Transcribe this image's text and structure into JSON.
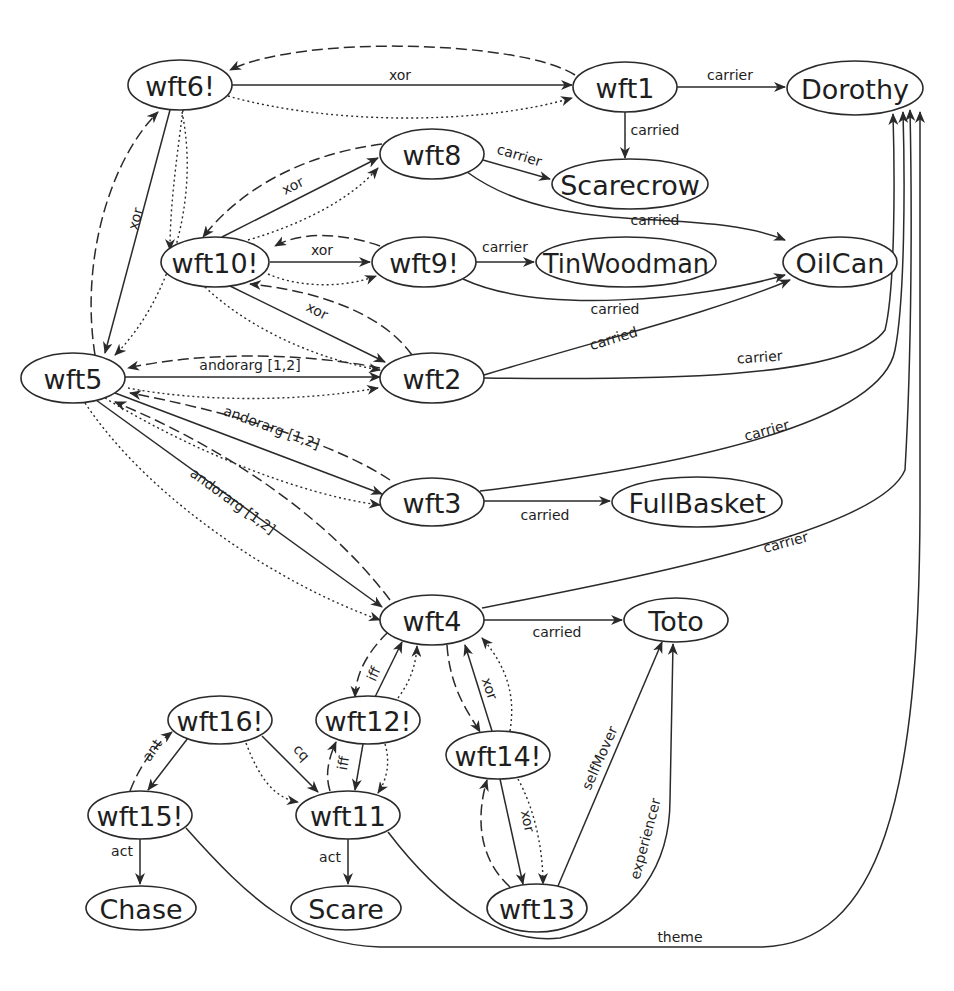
{
  "diagram": {
    "type": "propositional semantic network",
    "nodes": [
      {
        "id": "wft6",
        "label": "wft6!",
        "cx": 180,
        "cy": 85,
        "rx": 52,
        "ry": 25
      },
      {
        "id": "wft1",
        "label": "wft1",
        "cx": 625,
        "cy": 87,
        "rx": 52,
        "ry": 25
      },
      {
        "id": "Dorothy",
        "label": "Dorothy",
        "cx": 855,
        "cy": 88,
        "rx": 68,
        "ry": 27
      },
      {
        "id": "wft8",
        "label": "wft8",
        "cx": 432,
        "cy": 154,
        "rx": 52,
        "ry": 25
      },
      {
        "id": "Scarecrow",
        "label": "Scarecrow",
        "cx": 630,
        "cy": 184,
        "rx": 78,
        "ry": 25
      },
      {
        "id": "wft10",
        "label": "wft10!",
        "cx": 215,
        "cy": 262,
        "rx": 54,
        "ry": 25
      },
      {
        "id": "wft9",
        "label": "wft9!",
        "cx": 424,
        "cy": 262,
        "rx": 52,
        "ry": 25
      },
      {
        "id": "TinWoodman",
        "label": "TinWoodman",
        "cx": 626,
        "cy": 262,
        "rx": 90,
        "ry": 25
      },
      {
        "id": "OilCan",
        "label": "OilCan",
        "cx": 840,
        "cy": 262,
        "rx": 57,
        "ry": 25
      },
      {
        "id": "wft5",
        "label": "wft5",
        "cx": 73,
        "cy": 378,
        "rx": 52,
        "ry": 25
      },
      {
        "id": "wft2",
        "label": "wft2",
        "cx": 432,
        "cy": 378,
        "rx": 52,
        "ry": 25
      },
      {
        "id": "wft3",
        "label": "wft3",
        "cx": 432,
        "cy": 502,
        "rx": 52,
        "ry": 24
      },
      {
        "id": "FullBasket",
        "label": "FullBasket",
        "cx": 697,
        "cy": 502,
        "rx": 85,
        "ry": 25
      },
      {
        "id": "wft4",
        "label": "wft4",
        "cx": 432,
        "cy": 620,
        "rx": 52,
        "ry": 25
      },
      {
        "id": "Toto",
        "label": "Toto",
        "cx": 676,
        "cy": 620,
        "rx": 52,
        "ry": 22
      },
      {
        "id": "wft16",
        "label": "wft16!",
        "cx": 220,
        "cy": 720,
        "rx": 52,
        "ry": 24
      },
      {
        "id": "wft12",
        "label": "wft12!",
        "cx": 368,
        "cy": 720,
        "rx": 52,
        "ry": 24
      },
      {
        "id": "wft14",
        "label": "wft14!",
        "cx": 498,
        "cy": 755,
        "rx": 52,
        "ry": 24
      },
      {
        "id": "wft15",
        "label": "wft15!",
        "cx": 140,
        "cy": 815,
        "rx": 52,
        "ry": 24
      },
      {
        "id": "wft11",
        "label": "wft11",
        "cx": 348,
        "cy": 815,
        "rx": 52,
        "ry": 24
      },
      {
        "id": "Chase",
        "label": "Chase",
        "cx": 141,
        "cy": 908,
        "rx": 55,
        "ry": 22
      },
      {
        "id": "Scare",
        "label": "Scare",
        "cx": 346,
        "cy": 908,
        "rx": 55,
        "ry": 22
      },
      {
        "id": "wft13",
        "label": "wft13",
        "cx": 537,
        "cy": 908,
        "rx": 50,
        "ry": 24
      }
    ],
    "edges": [
      {
        "id": "e1",
        "from": "wft6",
        "to": "wft1",
        "label": "xor",
        "style": "solid",
        "d": "M232,85 L572,85",
        "lx": 400,
        "ly": 80,
        "rot": 0
      },
      {
        "id": "e2",
        "from": "wft1",
        "to": "wft6",
        "label": "",
        "style": "dashed",
        "d": "M575,75 C520,40 300,35 230,70",
        "lx": 0,
        "ly": 0,
        "rot": 0
      },
      {
        "id": "e3",
        "from": "wft6",
        "to": "wft1",
        "label": "",
        "style": "dotted",
        "d": "M228,96 C330,125 480,125 572,98",
        "lx": 0,
        "ly": 0,
        "rot": 0
      },
      {
        "id": "e4",
        "from": "wft1",
        "to": "Dorothy",
        "label": "carrier",
        "style": "solid",
        "d": "M677,87 L785,87",
        "lx": 730,
        "ly": 80,
        "rot": 0
      },
      {
        "id": "e5",
        "from": "wft1",
        "to": "Scarecrow",
        "label": "carried",
        "style": "solid",
        "d": "M625,112 L625,158",
        "lx": 655,
        "ly": 135,
        "rot": 0
      },
      {
        "id": "e6",
        "from": "wft6",
        "to": "wft5",
        "label": "xor",
        "style": "solid",
        "d": "M170,110 L105,353",
        "lx": 140,
        "ly": 220,
        "rot": -75
      },
      {
        "id": "e7",
        "from": "wft5",
        "to": "wft6",
        "label": "",
        "style": "dashed",
        "d": "M95,355 C80,260 110,160 158,112",
        "lx": 0,
        "ly": 0,
        "rot": 0
      },
      {
        "id": "e8",
        "from": "wft6",
        "to": "wft5",
        "label": "",
        "style": "dotted",
        "d": "M182,112 C200,200 170,300 115,355",
        "lx": 0,
        "ly": 0,
        "rot": 0
      },
      {
        "id": "e9",
        "from": "wft10",
        "to": "wft8",
        "label": "xor",
        "style": "solid",
        "d": "M222,237 L378,158",
        "lx": 295,
        "ly": 190,
        "rot": -27
      },
      {
        "id": "e10",
        "from": "wft8",
        "to": "wft10",
        "label": "",
        "style": "dashed",
        "d": "M382,144 C300,155 240,190 203,237",
        "lx": 0,
        "ly": 0,
        "rot": 0
      },
      {
        "id": "e11",
        "from": "wft10",
        "to": "wft8",
        "label": "",
        "style": "dotted",
        "d": "M248,240 C300,225 350,200 378,168",
        "lx": 0,
        "ly": 0,
        "rot": 0
      },
      {
        "id": "e12",
        "from": "wft8",
        "to": "Scarecrow",
        "label": "carrier",
        "style": "solid",
        "d": "M483,160 L550,179",
        "lx": 518,
        "ly": 160,
        "rot": 17
      },
      {
        "id": "e13",
        "from": "wft8",
        "to": "OilCan",
        "label": "carried",
        "style": "solid",
        "d": "M467,172 C560,240 700,205 785,240",
        "lx": 655,
        "ly": 225,
        "rot": 0
      },
      {
        "id": "e14",
        "from": "wft10",
        "to": "wft9",
        "label": "xor",
        "style": "solid",
        "d": "M270,262 L370,262",
        "lx": 322,
        "ly": 255,
        "rot": 0
      },
      {
        "id": "e15",
        "from": "wft9",
        "to": "wft10",
        "label": "",
        "style": "dashed",
        "d": "M380,246 C340,232 300,232 275,246",
        "lx": 0,
        "ly": 0,
        "rot": 0
      },
      {
        "id": "e16",
        "from": "wft10",
        "to": "wft9",
        "label": "",
        "style": "dotted",
        "d": "M268,274 C300,288 345,288 376,276",
        "lx": 0,
        "ly": 0,
        "rot": 0
      },
      {
        "id": "e17",
        "from": "wft9",
        "to": "TinWoodman",
        "label": "carrier",
        "style": "solid",
        "d": "M476,262 L534,262",
        "lx": 505,
        "ly": 252,
        "rot": 0
      },
      {
        "id": "e18",
        "from": "wft9",
        "to": "OilCan",
        "label": "carried",
        "style": "solid",
        "d": "M463,279 C540,315 700,300 785,275",
        "lx": 615,
        "ly": 314,
        "rot": 0
      },
      {
        "id": "e19",
        "from": "wft10",
        "to": "wft2",
        "label": "xor",
        "style": "solid",
        "d": "M230,286 L385,362",
        "lx": 315,
        "ly": 315,
        "rot": 27
      },
      {
        "id": "e20",
        "from": "wft2",
        "to": "wft10",
        "label": "",
        "style": "dashed",
        "d": "M412,355 C380,310 310,290 250,284",
        "lx": 0,
        "ly": 0,
        "rot": 0
      },
      {
        "id": "e21",
        "from": "wft10",
        "to": "wft2",
        "label": "",
        "style": "dotted",
        "d": "M205,287 C250,330 320,360 380,370",
        "lx": 0,
        "ly": 0,
        "rot": 0
      },
      {
        "id": "e22",
        "from": "wft6",
        "to": "wft10",
        "label": "",
        "style": "dotted",
        "d": "M183,110 C175,170 170,210 170,250",
        "lx": 0,
        "ly": 0,
        "rot": 0
      },
      {
        "id": "e23",
        "from": "wft5",
        "to": "wft2",
        "label": "andorarg [1,2]",
        "style": "solid",
        "d": "M125,377 L380,377",
        "lx": 250,
        "ly": 370,
        "rot": 0
      },
      {
        "id": "e24",
        "from": "wft2",
        "to": "wft5",
        "label": "",
        "style": "dashed",
        "d": "M380,368 C300,352 200,352 128,368",
        "lx": 0,
        "ly": 0,
        "rot": 0
      },
      {
        "id": "e25",
        "from": "wft5",
        "to": "wft2",
        "label": "",
        "style": "dotted",
        "d": "M128,388 C200,402 300,402 378,388",
        "lx": 0,
        "ly": 0,
        "rot": 0
      },
      {
        "id": "e26",
        "from": "wft5",
        "to": "wft3",
        "label": "andorarg [1,2]",
        "style": "solid",
        "d": "M115,393 L382,494",
        "lx": 270,
        "ly": 432,
        "rot": 20
      },
      {
        "id": "e27",
        "from": "wft3",
        "to": "wft5",
        "label": "",
        "style": "dashed",
        "d": "M390,480 C330,440 220,410 130,393",
        "lx": 0,
        "ly": 0,
        "rot": 0
      },
      {
        "id": "e28",
        "from": "wft5",
        "to": "wft3",
        "label": "",
        "style": "dotted",
        "d": "M105,398 C190,450 300,495 380,505",
        "lx": 0,
        "ly": 0,
        "rot": 0
      },
      {
        "id": "e29",
        "from": "wft5",
        "to": "wft4",
        "label": "andorarg [1,2]",
        "style": "solid",
        "d": "M96,400 L382,607",
        "lx": 230,
        "ly": 505,
        "rot": 36
      },
      {
        "id": "e30",
        "from": "wft4",
        "to": "wft5",
        "label": "",
        "style": "dashed",
        "d": "M390,600 C330,520 230,450 115,402",
        "lx": 0,
        "ly": 0,
        "rot": 0
      },
      {
        "id": "e31",
        "from": "wft5",
        "to": "wft4",
        "label": "",
        "style": "dotted",
        "d": "M85,403 C150,500 280,585 380,620",
        "lx": 0,
        "ly": 0,
        "rot": 0
      },
      {
        "id": "e32",
        "from": "wft2",
        "to": "OilCan",
        "label": "carried",
        "style": "solid",
        "d": "M484,375 C600,340 720,310 790,280",
        "lx": 615,
        "ly": 343,
        "rot": -17
      },
      {
        "id": "e33",
        "from": "wft2",
        "to": "Dorothy",
        "label": "carrier",
        "style": "solid",
        "d": "M484,378 C650,380 850,380 885,330 C895,290 895,180 893,114",
        "lx": 760,
        "ly": 362,
        "rot": -4
      },
      {
        "id": "e34",
        "from": "wft3",
        "to": "FullBasket",
        "label": "carried",
        "style": "solid",
        "d": "M484,501 L610,501",
        "lx": 545,
        "ly": 520,
        "rot": 0
      },
      {
        "id": "e35",
        "from": "wft3",
        "to": "Dorothy",
        "label": "carrier",
        "style": "solid",
        "d": "M480,491 C650,470 880,430 895,350 C905,300 905,180 903,112",
        "lx": 768,
        "ly": 435,
        "rot": -15
      },
      {
        "id": "e36",
        "from": "wft4",
        "to": "Dorothy",
        "label": "carrier",
        "style": "solid",
        "d": "M482,608 C650,575 880,530 905,470 C912,350 912,200 910,110",
        "lx": 787,
        "ly": 547,
        "rot": -15
      },
      {
        "id": "e37",
        "from": "wft4",
        "to": "Toto",
        "label": "carried",
        "style": "solid",
        "d": "M484,620 L622,620",
        "lx": 557,
        "ly": 637,
        "rot": 0
      },
      {
        "id": "e38",
        "from": "wft12",
        "to": "wft4",
        "label": "iff",
        "style": "solid",
        "d": "M375,697 L402,642",
        "lx": 378,
        "ly": 676,
        "rot": -65
      },
      {
        "id": "e39",
        "from": "wft4",
        "to": "wft12",
        "label": "",
        "style": "dashed",
        "d": "M388,632 C365,655 356,675 355,697",
        "lx": 0,
        "ly": 0,
        "rot": 0
      },
      {
        "id": "e40",
        "from": "wft12",
        "to": "wft4",
        "label": "",
        "style": "dotted",
        "d": "M398,698 C410,682 416,665 417,646",
        "lx": 0,
        "ly": 0,
        "rot": 0
      },
      {
        "id": "e41",
        "from": "wft4",
        "to": "wft14",
        "label": "",
        "style": "dashed",
        "d": "M447,645 C450,690 470,715 480,732",
        "lx": 0,
        "ly": 0,
        "rot": 0
      },
      {
        "id": "e42",
        "from": "wft14",
        "to": "wft4",
        "label": "xor",
        "style": "solid",
        "d": "M492,731 L465,645",
        "lx": 485,
        "ly": 690,
        "rot": 72
      },
      {
        "id": "e43",
        "from": "wft14",
        "to": "wft4",
        "label": "",
        "style": "dotted",
        "d": "M510,731 C515,700 510,670 482,638",
        "lx": 0,
        "ly": 0,
        "rot": 0
      },
      {
        "id": "e44",
        "from": "wft16",
        "to": "wft15",
        "label": "ant",
        "style": "solid",
        "d": "M188,738 L148,790",
        "lx": 156,
        "ly": 753,
        "rot": -55
      },
      {
        "id": "e45",
        "from": "wft15",
        "to": "wft16",
        "label": "",
        "style": "dashed",
        "d": "M130,791 C140,765 155,745 172,732",
        "lx": 0,
        "ly": 0,
        "rot": 0
      },
      {
        "id": "e46",
        "from": "wft16",
        "to": "wft11",
        "label": "cq",
        "style": "solid",
        "d": "M262,736 L318,792",
        "lx": 298,
        "ly": 756,
        "rot": 48
      },
      {
        "id": "e47",
        "from": "wft16",
        "to": "wft11",
        "label": "",
        "style": "dotted",
        "d": "M246,743 C260,780 275,798 298,802",
        "lx": 0,
        "ly": 0,
        "rot": 0
      },
      {
        "id": "e48",
        "from": "wft12",
        "to": "wft11",
        "label": "iff",
        "style": "solid",
        "d": "M363,744 L355,790",
        "lx": 348,
        "ly": 764,
        "rot": -80
      },
      {
        "id": "e49",
        "from": "wft11",
        "to": "wft12",
        "label": "",
        "style": "dashed",
        "d": "M330,791 C325,775 328,760 336,742",
        "lx": 0,
        "ly": 0,
        "rot": 0
      },
      {
        "id": "e50",
        "from": "wft12",
        "to": "wft11",
        "label": "",
        "style": "dotted",
        "d": "M385,744 C390,760 388,778 378,793",
        "lx": 0,
        "ly": 0,
        "rot": 0
      },
      {
        "id": "e51",
        "from": "wft14",
        "to": "wft13",
        "label": "xor",
        "style": "solid",
        "d": "M500,779 L523,884",
        "lx": 523,
        "ly": 822,
        "rot": 78
      },
      {
        "id": "e52",
        "from": "wft13",
        "to": "wft14",
        "label": "",
        "style": "dashed",
        "d": "M510,887 C480,860 475,820 487,780",
        "lx": 0,
        "ly": 0,
        "rot": 0
      },
      {
        "id": "e53",
        "from": "wft14",
        "to": "wft13",
        "label": "",
        "style": "dotted",
        "d": "M518,779 C535,810 543,850 543,884",
        "lx": 0,
        "ly": 0,
        "rot": 0
      },
      {
        "id": "e54",
        "from": "wft15",
        "to": "Chase",
        "label": "act",
        "style": "solid",
        "d": "M140,839 L140,884",
        "lx": 122,
        "ly": 856,
        "rot": 0
      },
      {
        "id": "e55",
        "from": "wft11",
        "to": "Scare",
        "label": "act",
        "style": "solid",
        "d": "M348,839 L348,884",
        "lx": 330,
        "ly": 862,
        "rot": 0
      },
      {
        "id": "e56",
        "from": "wft13",
        "to": "Toto",
        "label": "selfMover",
        "style": "solid",
        "d": "M558,886 L662,642",
        "lx": 604,
        "ly": 760,
        "rot": -66
      },
      {
        "id": "e57",
        "from": "wft11",
        "to": "Toto",
        "label": "experiencer",
        "style": "solid",
        "d": "M388,832 C440,900 500,945 560,938 C640,920 670,860 670,800 L673,644",
        "lx": 650,
        "ly": 840,
        "rot": -75
      },
      {
        "id": "e58",
        "from": "wft15",
        "to": "Dorothy",
        "label": "theme",
        "style": "solid",
        "d": "M186,828 C250,900 300,945 380,947 L760,947 C880,945 920,800 920,500 L920,112",
        "lx": 680,
        "ly": 942,
        "rot": 0
      }
    ]
  }
}
